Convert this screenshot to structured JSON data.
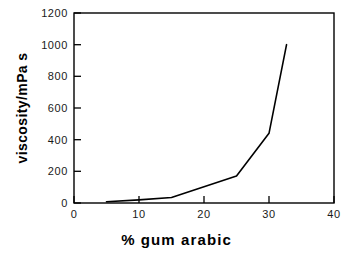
{
  "chart_data": {
    "type": "line",
    "title": "",
    "subtitle": "",
    "xlabel": "% gum arabic",
    "ylabel": "viscosity/mPa s",
    "xlim": [
      0,
      40
    ],
    "ylim": [
      0,
      1200
    ],
    "xticks": [
      0,
      10,
      20,
      30,
      40
    ],
    "yticks": [
      0,
      200,
      400,
      600,
      800,
      1000,
      1200
    ],
    "xtick_labels": [
      "0",
      "10",
      "20",
      "30",
      "40"
    ],
    "ytick_labels": [
      "0",
      "200",
      "400",
      "600",
      "800",
      "1000",
      "1200"
    ],
    "grid": false,
    "legend": null,
    "legend_position": "none",
    "line_color": "#000000",
    "line_width": 1.6,
    "axis_color": "#000000",
    "background_color": "#ffffff",
    "tick_direction": "in",
    "series": [
      {
        "name": "viscosity",
        "x": [
          5,
          10,
          15,
          25,
          30,
          32.7
        ],
        "values": [
          8,
          20,
          35,
          170,
          440,
          1000
        ]
      }
    ],
    "annotations": []
  },
  "axes": {
    "y_label": "viscosity/mPa s",
    "x_label": "% gum arabic"
  }
}
